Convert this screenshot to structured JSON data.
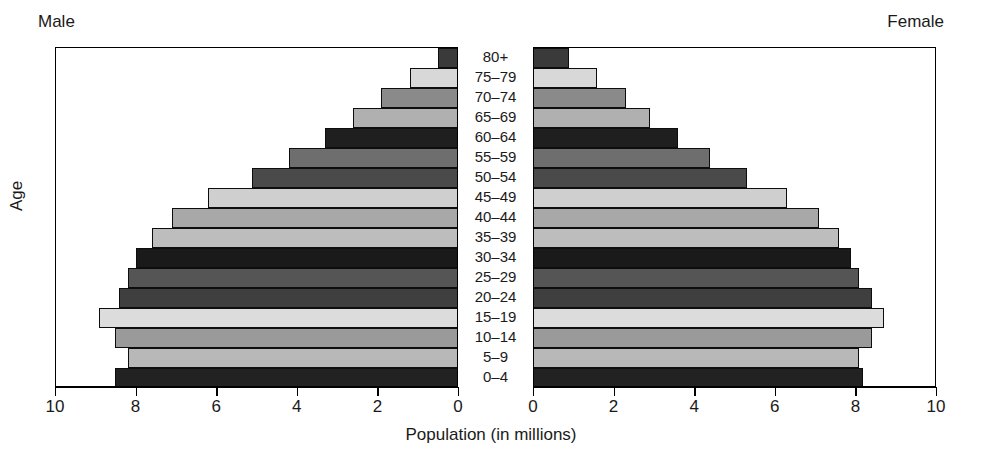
{
  "header": {
    "male_label": "Male",
    "female_label": "Female"
  },
  "axes": {
    "y_title": "Age",
    "x_title": "Population (in millions)",
    "left_ticks": [
      "10",
      "8",
      "6",
      "4",
      "2",
      "0"
    ],
    "right_ticks": [
      "0",
      "2",
      "4",
      "6",
      "8",
      "10"
    ]
  },
  "chart_data": {
    "type": "bar",
    "title": "",
    "subtitle": "",
    "xlabel": "Population (in millions)",
    "ylabel": "Age",
    "xlim": [
      0,
      10
    ],
    "grid": false,
    "legend": "none",
    "orientation": "horizontal",
    "style": "population-pyramid",
    "categories": [
      "80+",
      "75–79",
      "70–74",
      "65–69",
      "60–64",
      "55–59",
      "50–54",
      "45–49",
      "40–44",
      "35–39",
      "30–34",
      "25–29",
      "20–24",
      "15–19",
      "10–14",
      "5–9",
      "0–4"
    ],
    "series": [
      {
        "name": "Male",
        "side": "left",
        "values": [
          0.5,
          1.2,
          1.9,
          2.6,
          3.3,
          4.2,
          5.1,
          6.2,
          7.1,
          7.6,
          8.0,
          8.2,
          8.4,
          8.9,
          8.5,
          8.2,
          8.5
        ]
      },
      {
        "name": "Female",
        "side": "right",
        "values": [
          0.9,
          1.6,
          2.3,
          2.9,
          3.6,
          4.4,
          5.3,
          6.3,
          7.1,
          7.6,
          7.9,
          8.1,
          8.4,
          8.7,
          8.4,
          8.1,
          8.2
        ]
      }
    ],
    "bar_shades": [
      "#3a3a3a",
      "#d8d8d8",
      "#8a8a8a",
      "#b0b0b0",
      "#1f1f1f",
      "#6e6e6e",
      "#4a4a4a",
      "#cfcfcf",
      "#a8a8a8",
      "#bdbdbd",
      "#1a1a1a",
      "#555555",
      "#3f3f3f",
      "#dcdcdc",
      "#9a9a9a",
      "#b8b8b8",
      "#222222"
    ]
  }
}
